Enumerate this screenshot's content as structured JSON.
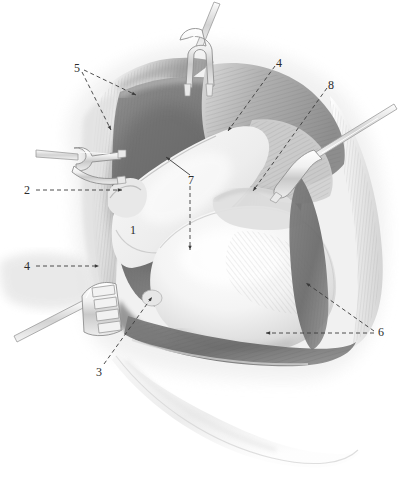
{
  "figure": {
    "width": 399,
    "height": 490,
    "background": "#ffffff",
    "medium": "grayscale airbrush / pencil medical illustration",
    "label_color": "#2b2b2b",
    "leader_color": "#3a3a3a"
  },
  "labels": [
    {
      "id": "label-1",
      "text": "1",
      "x": 130,
      "y": 224,
      "leaders": []
    },
    {
      "id": "label-2",
      "text": "2",
      "x": 24,
      "y": 184,
      "leaders": [
        {
          "style": "dashed",
          "points": [
            [
              36,
              190
            ],
            [
              122,
              190
            ]
          ],
          "arrow": true
        }
      ]
    },
    {
      "id": "label-3",
      "text": "3",
      "x": 96,
      "y": 366,
      "leaders": [
        {
          "style": "dashed",
          "points": [
            [
              104,
              364
            ],
            [
              152,
              297
            ]
          ],
          "arrow": true
        }
      ]
    },
    {
      "id": "label-4-left",
      "text": "4",
      "x": 24,
      "y": 260,
      "leaders": [
        {
          "style": "dashed",
          "points": [
            [
              36,
              266
            ],
            [
              99,
              266
            ]
          ],
          "arrow": true
        }
      ]
    },
    {
      "id": "label-4-top",
      "text": "4",
      "x": 276,
      "y": 57,
      "leaders": [
        {
          "style": "dashed",
          "points": [
            [
              275,
              66
            ],
            [
              228,
              131
            ]
          ],
          "arrow": true
        }
      ]
    },
    {
      "id": "label-5",
      "text": "5",
      "x": 74,
      "y": 62,
      "leaders": [
        {
          "style": "dashed",
          "points": [
            [
              84,
              70
            ],
            [
              136,
              95
            ]
          ],
          "arrow": true
        },
        {
          "style": "dashed",
          "points": [
            [
              82,
              72
            ],
            [
              111,
              130
            ]
          ],
          "arrow": true
        }
      ]
    },
    {
      "id": "label-6",
      "text": "6",
      "x": 378,
      "y": 326,
      "leaders": [
        {
          "style": "dashed",
          "points": [
            [
              374,
              331
            ],
            [
              306,
              283
            ]
          ],
          "arrow": true
        },
        {
          "style": "dashed",
          "points": [
            [
              374,
              333
            ],
            [
              266,
              333
            ]
          ],
          "arrow": true
        }
      ]
    },
    {
      "id": "label-7",
      "text": "7",
      "x": 188,
      "y": 174,
      "leaders": [
        {
          "style": "solid",
          "points": [
            [
              190,
              175
            ],
            [
              166,
              157
            ]
          ],
          "arrow": true
        },
        {
          "style": "dashed",
          "points": [
            [
              190,
              186
            ],
            [
              190,
              250
            ]
          ],
          "arrow": true
        }
      ]
    },
    {
      "id": "label-8",
      "text": "8",
      "x": 328,
      "y": 79,
      "leaders": [
        {
          "style": "dashed",
          "points": [
            [
              327,
              88
            ],
            [
              253,
              191
            ]
          ],
          "arrow": true
        }
      ]
    }
  ],
  "instruments": [
    {
      "name": "two-prong-retractor-top",
      "type": "double hook retractor",
      "position": "top center, shaft to upper right"
    },
    {
      "name": "two-prong-retractor-left",
      "type": "double hook retractor",
      "position": "left middle, shaft to left"
    },
    {
      "name": "single-prong-retractor-right",
      "type": "single hook retractor",
      "position": "right upper, shaft to upper right"
    },
    {
      "name": "four-prong-rake-retractor",
      "type": "rake retractor",
      "position": "lower left, shaft to lower left"
    }
  ],
  "anatomy_regions": [
    {
      "name": "wound-margin-upper-left",
      "tone": "mid grey"
    },
    {
      "name": "deep-muscle-cavity",
      "tone": "dark grey"
    },
    {
      "name": "bone-head",
      "tone": "light / near white"
    },
    {
      "name": "tendon-band-oblique",
      "tone": "pale grey"
    },
    {
      "name": "muscle-belly-right",
      "tone": "mid grey with fiber striations"
    },
    {
      "name": "capsule-rim",
      "tone": "light grey"
    },
    {
      "name": "skin-flap-lower",
      "tone": "very pale grey"
    }
  ]
}
